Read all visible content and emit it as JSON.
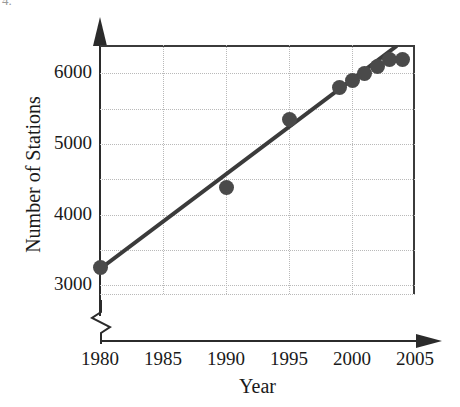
{
  "problem_number": "4.",
  "chart_data": {
    "type": "scatter",
    "title": "",
    "xlabel": "Year",
    "ylabel": "Number of Stations",
    "xlim": [
      1980,
      2005
    ],
    "ylim": [
      2875,
      6400
    ],
    "y_axis_break": true,
    "grid": true,
    "legend": "none",
    "xticks": [
      "1980",
      "1985",
      "1990",
      "1995",
      "2000",
      "2005"
    ],
    "xtick_values": [
      1980,
      1985,
      1990,
      1995,
      2000,
      2005
    ],
    "yticks": [
      "3000",
      "4000",
      "5000",
      "6000"
    ],
    "ytick_values": [
      3000,
      4000,
      5000,
      6000
    ],
    "y_gridline_values": [
      3000,
      3500,
      4000,
      4500,
      5000,
      5500,
      6000
    ],
    "x": [
      1980,
      1990,
      1995,
      1999,
      2000,
      2001,
      2002,
      2003,
      2004
    ],
    "y": [
      3250,
      4380,
      5350,
      5800,
      5900,
      6000,
      6100,
      6200,
      6200
    ],
    "series": [
      {
        "name": "Number of Stations",
        "points": [
          {
            "x": 1980,
            "y": 3250
          },
          {
            "x": 1990,
            "y": 4380
          },
          {
            "x": 1995,
            "y": 5350
          },
          {
            "x": 1999,
            "y": 5800
          },
          {
            "x": 2000,
            "y": 5900
          },
          {
            "x": 2001,
            "y": 6000
          },
          {
            "x": 2002,
            "y": 6100
          },
          {
            "x": 2003,
            "y": 6200
          },
          {
            "x": 2004,
            "y": 6200
          }
        ]
      }
    ],
    "trend_line": {
      "type": "linear-fit",
      "x_start": 1980,
      "y_start": 3230,
      "x_end": 2003.5,
      "y_end": 6380
    },
    "colors": {
      "marker": "#4a4a4a",
      "trend_line": "#3b3b3b",
      "axis": "#2b2b2b",
      "gridline": "#b9b9b9",
      "text": "#1a1a1a",
      "background": "#ffffff"
    }
  }
}
